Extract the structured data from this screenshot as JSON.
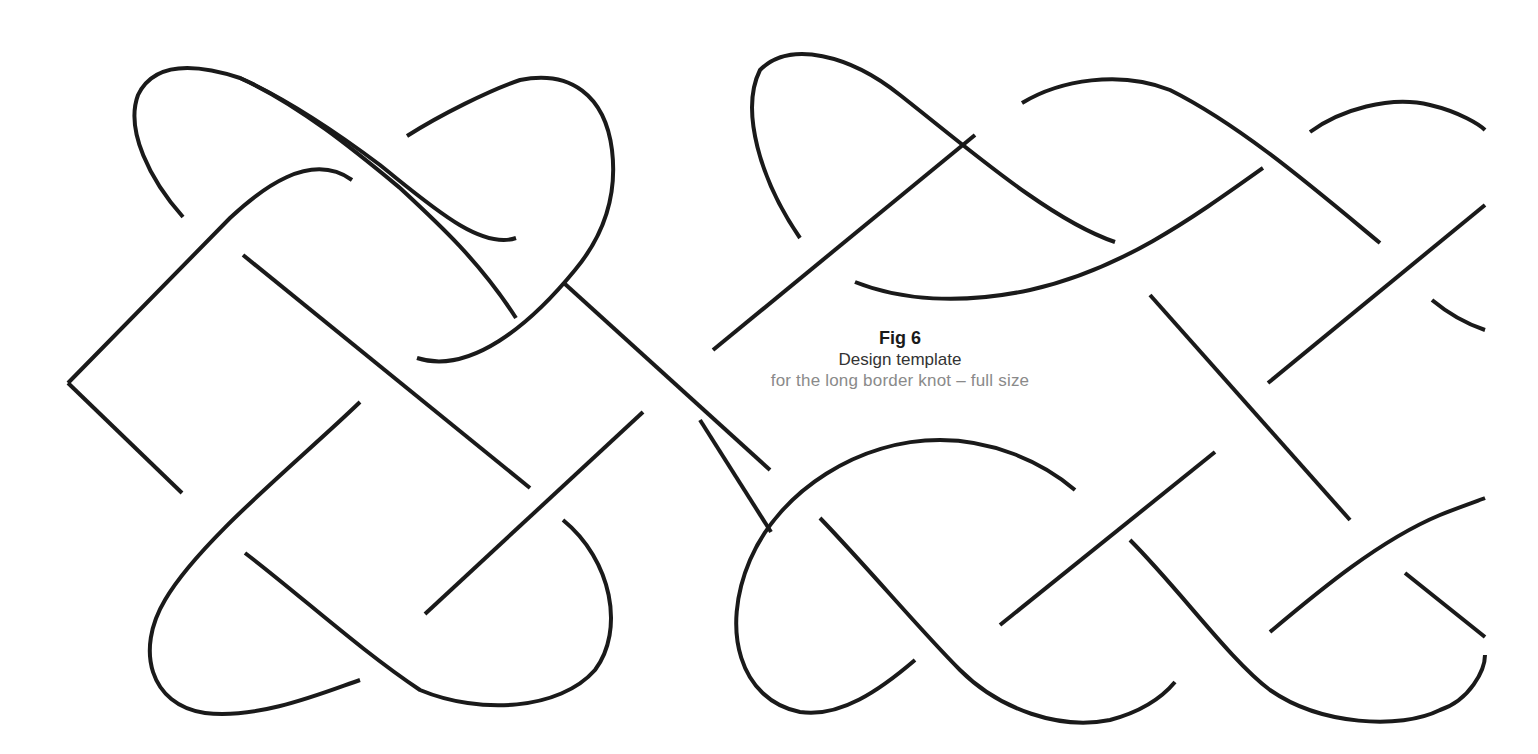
{
  "figure": {
    "label": "Fig 6",
    "title": "Design template",
    "description": "for the long border knot – full size"
  },
  "colors": {
    "line": "#1a1a1a",
    "label": "#1a1a1a",
    "title": "#333333",
    "description": "#8a8a8a",
    "background": "#ffffff"
  },
  "drawing": {
    "subject": "celtic-long-border-knot",
    "stroke_width": 4
  }
}
